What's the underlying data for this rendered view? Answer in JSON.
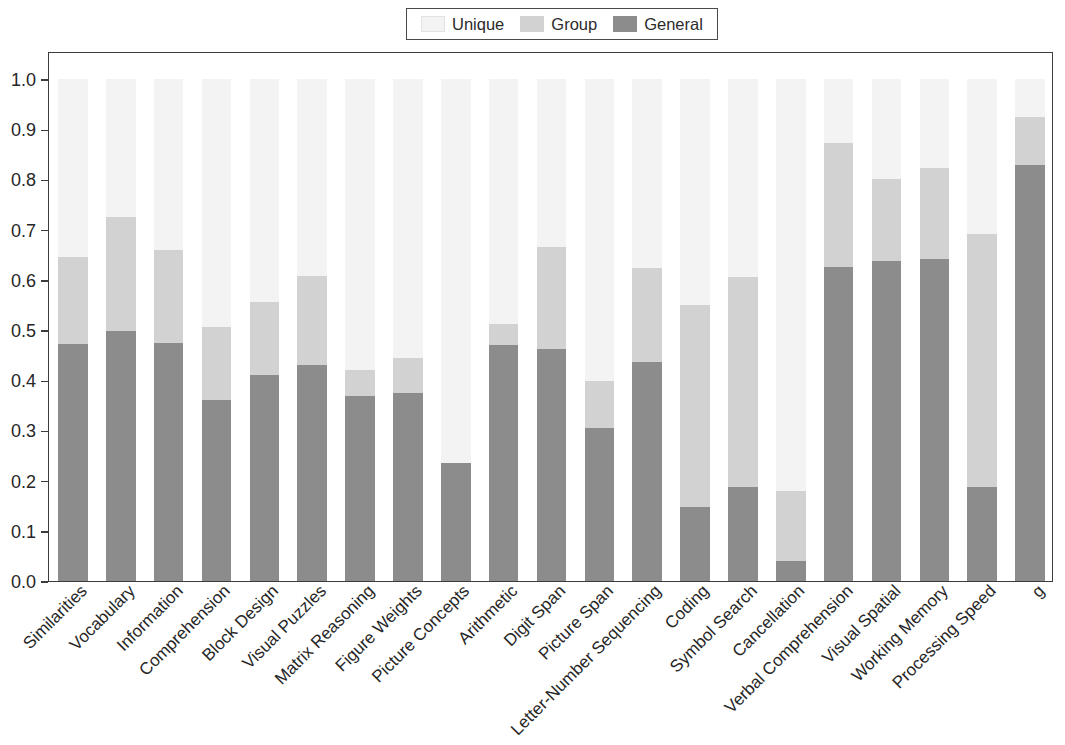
{
  "chart_data": {
    "type": "bar",
    "stacked": true,
    "title": "",
    "xlabel": "",
    "ylabel": "",
    "ylim": [
      0.0,
      1.0
    ],
    "grid": false,
    "legend_position": "top-center",
    "ytick_labels": [
      "0.0",
      "0.1",
      "0.2",
      "0.3",
      "0.4",
      "0.5",
      "0.6",
      "0.7",
      "0.8",
      "0.9",
      "1.0"
    ],
    "ytick_values": [
      0.0,
      0.1,
      0.2,
      0.3,
      0.4,
      0.5,
      0.6,
      0.7,
      0.8,
      0.9,
      1.0
    ],
    "categories": [
      "Similarities",
      "Vocabulary",
      "Information",
      "Comprehension",
      "Block Design",
      "Visual Puzzles",
      "Matrix Reasoning",
      "Figure Weights",
      "Picture Concepts",
      "Arithmetic",
      "Digit Span",
      "Picture Span",
      "Letter-Number Sequencing",
      "Coding",
      "Symbol Search",
      "Cancellation",
      "Verbal Comprehension",
      "Visual Spatial",
      "Working Memory",
      "Processing Speed",
      "g"
    ],
    "series": [
      {
        "name": "General",
        "color": "#8c8c8c",
        "values": [
          0.472,
          0.498,
          0.475,
          0.36,
          0.411,
          0.43,
          0.368,
          0.375,
          0.235,
          0.47,
          0.463,
          0.305,
          0.437,
          0.147,
          0.188,
          0.04,
          0.625,
          0.637,
          0.641,
          0.188,
          0.828
        ]
      },
      {
        "name": "Group",
        "color": "#d2d2d2",
        "values": [
          0.173,
          0.227,
          0.185,
          0.147,
          0.145,
          0.178,
          0.052,
          0.069,
          0.0,
          0.042,
          0.203,
          0.093,
          0.187,
          0.403,
          0.418,
          0.14,
          0.248,
          0.163,
          0.182,
          0.504,
          0.097
        ]
      },
      {
        "name": "Unique",
        "color": "#f3f3f3",
        "values": [
          0.355,
          0.275,
          0.34,
          0.493,
          0.444,
          0.392,
          0.58,
          0.556,
          0.765,
          0.488,
          0.334,
          0.602,
          0.376,
          0.45,
          0.394,
          0.82,
          0.127,
          0.2,
          0.177,
          0.308,
          0.075
        ]
      }
    ],
    "stack_tops": {
      "general": [
        0.472,
        0.498,
        0.475,
        0.36,
        0.411,
        0.43,
        0.368,
        0.375,
        0.235,
        0.47,
        0.463,
        0.305,
        0.437,
        0.147,
        0.188,
        0.04,
        0.625,
        0.637,
        0.641,
        0.188,
        0.828
      ],
      "group": [
        0.645,
        0.725,
        0.66,
        0.507,
        0.556,
        0.608,
        0.42,
        0.444,
        0.235,
        0.512,
        0.666,
        0.398,
        0.624,
        0.55,
        0.606,
        0.18,
        0.873,
        0.8,
        0.823,
        0.692,
        0.925
      ],
      "unique": [
        1.0,
        1.0,
        1.0,
        1.0,
        1.0,
        1.0,
        1.0,
        1.0,
        1.0,
        1.0,
        1.0,
        1.0,
        1.0,
        1.0,
        1.0,
        1.0,
        1.0,
        1.0,
        1.0,
        1.0,
        1.0
      ]
    }
  },
  "legend": {
    "entries": [
      {
        "label": "Unique",
        "color": "#f3f3f3"
      },
      {
        "label": "Group",
        "color": "#d2d2d2"
      },
      {
        "label": "General",
        "color": "#8c8c8c"
      }
    ]
  },
  "colors": {
    "unique": "#f3f3f3",
    "group": "#d2d2d2",
    "general": "#8c8c8c",
    "axis": "#3c3c3c",
    "text": "#262626",
    "background": "#ffffff"
  }
}
